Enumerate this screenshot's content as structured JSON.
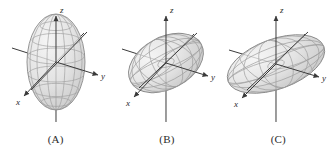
{
  "figure": {
    "background_color": "#ffffff",
    "width": 334,
    "height": 148
  },
  "style": {
    "axis_color": "#3a3a3a",
    "surface_fill": "#d8d8d8",
    "mesh_color": "#9a9a9a",
    "outline_color": "#8a8a8a",
    "label_color": "#2b2b2b",
    "tilt_line_color": "#3a3a3a"
  },
  "axes_labels": {
    "x": "x",
    "y": "y",
    "z": "z"
  },
  "panels": [
    {
      "id": "A",
      "caption": "(A)",
      "shape": "prolate ellipsoid elongated along z-axis",
      "semi_axes": {
        "a": 30,
        "b": 30,
        "c": 55
      },
      "tilt_degrees": 0,
      "axes": {
        "x": "x",
        "y": "y",
        "z": "z"
      }
    },
    {
      "id": "B",
      "caption": "(B)",
      "shape": "tilted ellipsoid, nearly spherical, inclined toward x-y diagonal",
      "semi_axes": {
        "a": 42,
        "b": 42,
        "c": 28
      },
      "tilt_degrees": 28,
      "axes": {
        "x": "x",
        "y": "y",
        "z": "z"
      }
    },
    {
      "id": "C",
      "caption": "(C)",
      "shape": "oblate ellipsoid elongated horizontally along the x-y plane",
      "semi_axes": {
        "a": 52,
        "b": 52,
        "c": 25
      },
      "tilt_degrees": 20,
      "axes": {
        "x": "x",
        "y": "y",
        "z": "z"
      }
    }
  ]
}
